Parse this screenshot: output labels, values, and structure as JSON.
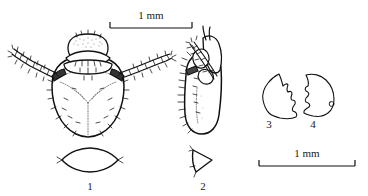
{
  "plate": {
    "title": "Scientific line-drawing plate of mite/insect larva structures",
    "background_color": "#ffffff",
    "ink_color": "#111111",
    "width": 368,
    "height": 196
  },
  "scale_bars": [
    {
      "id": "scale-bar-top",
      "label": "1 mm",
      "x_start": 110,
      "x_end": 192,
      "y": 27,
      "label_x": 151,
      "label_y": 19
    },
    {
      "id": "scale-bar-bottom",
      "label": "1 mm",
      "x_start": 259,
      "x_end": 355,
      "y": 165,
      "label_x": 307,
      "label_y": 157
    }
  ],
  "figures": [
    {
      "id": "figure-1",
      "label": "1",
      "caption_x": 90,
      "caption_y": 190,
      "description": "dorsal view of larva body with head, antennae and setae"
    },
    {
      "id": "figure-2",
      "label": "2",
      "caption_x": 203,
      "caption_y": 190,
      "description": "lateral view of larva body with setae along margin"
    },
    {
      "id": "figure-3",
      "label": "3",
      "caption_x": 269,
      "caption_y": 128,
      "description": "mandible outline, left"
    },
    {
      "id": "figure-4",
      "label": "4",
      "caption_x": 313,
      "caption_y": 128,
      "description": "mandible outline, right"
    }
  ],
  "inset_structures": [
    {
      "id": "inset-1",
      "belongs_to": "figure-1",
      "shape": "lens-shaped-plate"
    },
    {
      "id": "inset-2",
      "belongs_to": "figure-2",
      "shape": "triangular-plate"
    }
  ]
}
